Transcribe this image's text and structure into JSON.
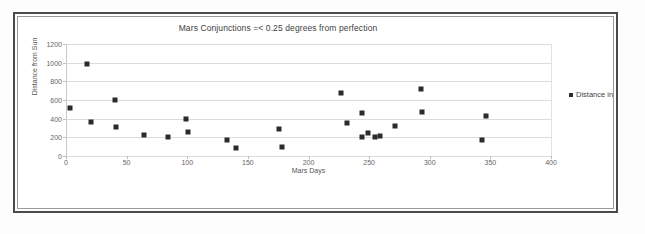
{
  "chart_data": {
    "type": "scatter",
    "title": "Mars Conjunctions =< 0.25 degrees from perfection",
    "xlabel": "Mars Days",
    "ylabel": "Distance from Sun",
    "xlim": [
      0,
      400
    ],
    "ylim": [
      0,
      1200
    ],
    "xticks": [
      0,
      50,
      100,
      150,
      200,
      250,
      300,
      350,
      400
    ],
    "yticks": [
      0,
      200,
      400,
      600,
      800,
      1000,
      1200
    ],
    "grid": "horizontal",
    "legend_position": "right",
    "marker": "square",
    "marker_color": "#2b2b2b",
    "series": [
      {
        "name": "Distance in Ly",
        "points": [
          [
            3,
            515
          ],
          [
            17,
            985
          ],
          [
            21,
            360
          ],
          [
            40,
            605
          ],
          [
            41,
            310
          ],
          [
            64,
            230
          ],
          [
            84,
            205
          ],
          [
            99,
            395
          ],
          [
            101,
            255
          ],
          [
            133,
            175
          ],
          [
            140,
            90
          ],
          [
            176,
            290
          ],
          [
            178,
            95
          ],
          [
            227,
            675
          ],
          [
            232,
            355
          ],
          [
            244,
            460
          ],
          [
            244,
            200
          ],
          [
            249,
            245
          ],
          [
            255,
            205
          ],
          [
            259,
            210
          ],
          [
            271,
            320
          ],
          [
            293,
            720
          ],
          [
            294,
            475
          ],
          [
            343,
            175
          ],
          [
            346,
            425
          ]
        ]
      }
    ]
  },
  "legend": {
    "items": [
      {
        "label": "Distance in Ly",
        "swatch": "legend-square-marker"
      }
    ]
  },
  "colors": {
    "marker": "#2b2b2b",
    "gridline": "#dcdcdc",
    "axis": "#b4b4b4",
    "text": "#3f3f3f",
    "frame_outer": "#4a4a4a",
    "frame_inner": "#9a9a9a",
    "background": "#ffffff"
  }
}
